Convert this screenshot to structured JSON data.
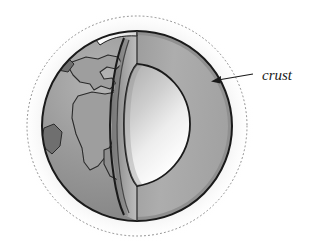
{
  "figure": {
    "title": "",
    "background_color": "#ffffff"
  },
  "labels": [
    {
      "id": "crust",
      "text": "crust",
      "style": "italic-serif",
      "text_x": 262,
      "text_y": 79,
      "leader_start_x": 253,
      "leader_start_y": 74,
      "leader_end_x": 213,
      "leader_end_y": 81,
      "arrow": "left-pointing"
    }
  ],
  "geometry": {
    "globe": {
      "center_x": 137,
      "center_y": 126,
      "radius": 95
    },
    "atmosphere_ring": {
      "center_x": 137,
      "center_y": 126,
      "radius": 110,
      "stroke_style": "dotted"
    },
    "core": {
      "center_x": 160,
      "center_y": 122,
      "radius_x": 48,
      "radius_y": 60
    }
  },
  "colors": {
    "ocean": "#939393",
    "continent": "#9e9e9e",
    "continent_dark": "#6f6f6f",
    "mantle_face": "#a8a8a8",
    "mantle_shadow": "#8c8c8c",
    "core_light": "#ffffff",
    "core_mid": "#bdbdbd",
    "crust_band": "#f2f2f2",
    "outline": "#1a1a1a",
    "atmosphere_dots": "#8a8a8a",
    "glow": "#ffffff",
    "label_text": "#1a1a1a"
  },
  "icon_names": {
    "globe": "globe-icon",
    "arrow": "arrow-left-icon",
    "atmosphere": "dotted-circle-icon"
  }
}
